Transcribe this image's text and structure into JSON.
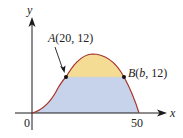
{
  "diagram": {
    "type": "function-graph-with-shaded-regions",
    "axes": {
      "x_label": "x",
      "y_label": "y",
      "origin_label": "0",
      "x_tick_label": "50"
    },
    "points": {
      "A": {
        "label": "A(20, 12)",
        "x": 20,
        "y": 12
      },
      "B": {
        "label": "B(b, 12)",
        "x": "b",
        "y": 12
      }
    },
    "regions": {
      "upper": {
        "description": "region above y=12 under curve",
        "color": "#f5dc95"
      },
      "lower": {
        "description": "region below y=12 under curve",
        "color": "#c7d3ea"
      }
    },
    "colors": {
      "curve": "#a8322a",
      "axis": "#1a1a1a",
      "point": "#111111"
    }
  }
}
